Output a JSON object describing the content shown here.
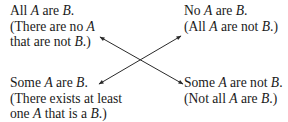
{
  "diagram": {
    "type": "square-of-opposition",
    "statements": {
      "top_left": {
        "lines": [
          [
            {
              "t": "All "
            },
            {
              "t": "A",
              "i": true
            },
            {
              "t": " are "
            },
            {
              "t": "B",
              "i": true
            },
            {
              "t": "."
            }
          ],
          [
            {
              "t": "(There are no "
            },
            {
              "t": "A",
              "i": true
            }
          ],
          [
            {
              "t": "that are not "
            },
            {
              "t": "B",
              "i": true
            },
            {
              "t": ".)"
            }
          ]
        ]
      },
      "top_right": {
        "lines": [
          [
            {
              "t": "No "
            },
            {
              "t": "A",
              "i": true
            },
            {
              "t": " are "
            },
            {
              "t": "B",
              "i": true
            },
            {
              "t": "."
            }
          ],
          [
            {
              "t": "(All "
            },
            {
              "t": "A",
              "i": true
            },
            {
              "t": " are not "
            },
            {
              "t": "B",
              "i": true
            },
            {
              "t": ".)"
            }
          ]
        ]
      },
      "bottom_left": {
        "lines": [
          [
            {
              "t": "Some "
            },
            {
              "t": "A",
              "i": true
            },
            {
              "t": " are "
            },
            {
              "t": "B",
              "i": true
            },
            {
              "t": "."
            }
          ],
          [
            {
              "t": "(There exists at least"
            }
          ],
          [
            {
              "t": "one "
            },
            {
              "t": "A",
              "i": true
            },
            {
              "t": " that is a "
            },
            {
              "t": "B",
              "i": true
            },
            {
              "t": ".)"
            }
          ]
        ]
      },
      "bottom_right": {
        "lines": [
          [
            {
              "t": "Some "
            },
            {
              "t": "A",
              "i": true
            },
            {
              "t": " are not "
            },
            {
              "t": "B",
              "i": true
            },
            {
              "t": "."
            }
          ],
          [
            {
              "t": "(Not all "
            },
            {
              "t": "A",
              "i": true
            },
            {
              "t": " are "
            },
            {
              "t": "B",
              "i": true
            },
            {
              "t": ".)"
            }
          ]
        ]
      }
    },
    "connections": [
      {
        "from": "top_left",
        "to": "bottom_right",
        "relation": "contradictory",
        "arrows": "both"
      },
      {
        "from": "top_right",
        "to": "bottom_left",
        "relation": "contradictory",
        "arrows": "both"
      }
    ],
    "colors": {
      "text": "#1a1a1a",
      "arrow": "#2a2a2a",
      "background": "#ffffff"
    }
  }
}
